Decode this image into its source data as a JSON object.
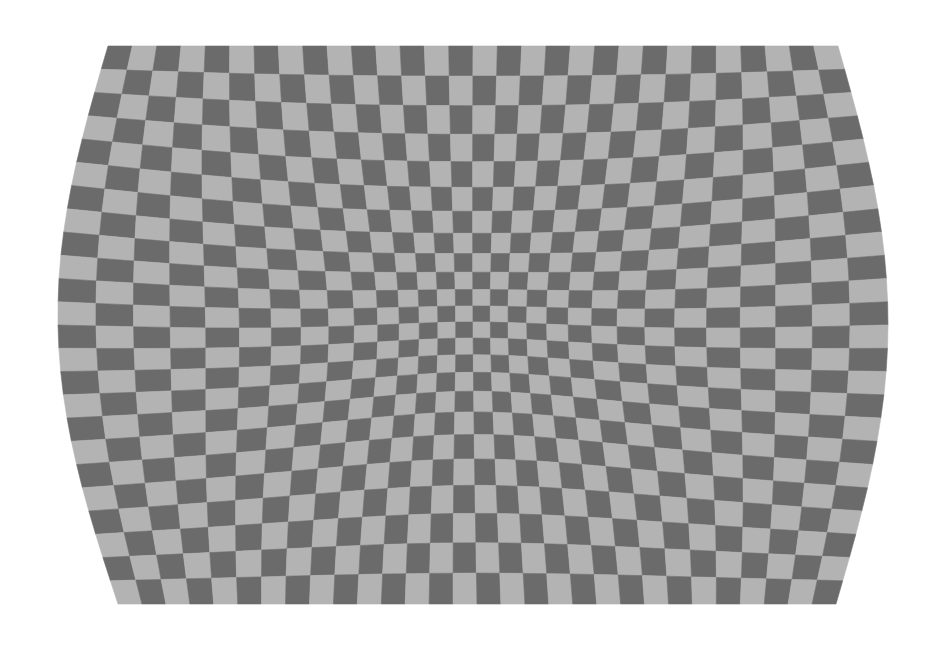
{
  "image": {
    "description": "Distorted grey checkerboard with barrel-warped edges and a pinched, denser center",
    "background": "#ffffff",
    "colors": {
      "dark": "#6b6b6b",
      "light": "#b3b3b3"
    },
    "grid": {
      "cols": 30,
      "rows": 24
    },
    "bounds": {
      "top": 46,
      "bottom": 604,
      "top_left_x": 108,
      "top_right_x": 838,
      "bottom_left_x": 118,
      "bottom_right_x": 836,
      "mid_left_x": 58,
      "mid_right_x": 888
    }
  }
}
